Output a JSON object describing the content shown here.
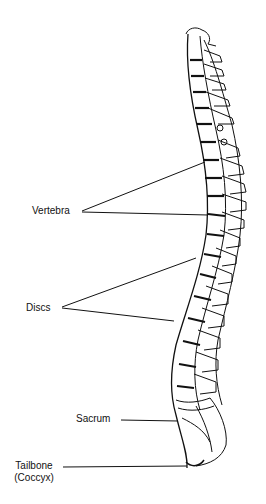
{
  "diagram": {
    "type": "anatomical-illustration",
    "colors": {
      "ink": "#111111",
      "background": "#ffffff"
    },
    "labels": [
      {
        "id": "vertebra",
        "text": "Vertebra"
      },
      {
        "id": "discs",
        "text": "Discs"
      },
      {
        "id": "sacrum",
        "text": "Sacrum"
      },
      {
        "id": "tailbone",
        "text": "Tailbone",
        "subtext": "(Coccyx)"
      }
    ]
  }
}
